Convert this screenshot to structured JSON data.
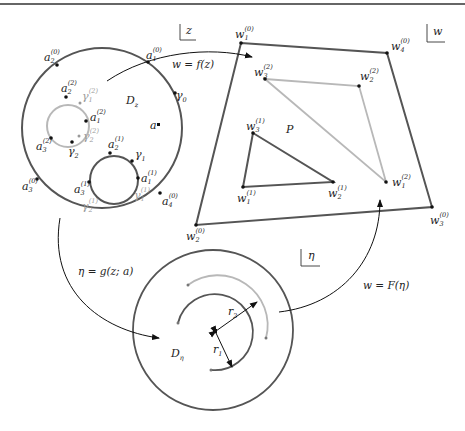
{
  "figure": {
    "top_rule": true,
    "colors": {
      "dark": "#555555",
      "light": "#b8b8b8",
      "ink": "#111111"
    },
    "planes": {
      "z": {
        "label": "z"
      },
      "w": {
        "label": "w"
      },
      "eta": {
        "label": "η"
      }
    },
    "domain_z": {
      "label": "D",
      "sub": "z",
      "point_a": "a",
      "outer_boundary": "γ",
      "outer_boundary_sub": "0",
      "outer_vertices": [
        {
          "base": "a",
          "sub": "1",
          "sup": "(0)"
        },
        {
          "base": "a",
          "sub": "2",
          "sup": "(0)"
        },
        {
          "base": "a",
          "sub": "3",
          "sup": "(0)"
        },
        {
          "base": "a",
          "sub": "4",
          "sup": "(0)"
        }
      ],
      "hole_1": {
        "boundary": "γ",
        "boundary_sub": "1",
        "vertices": [
          {
            "base": "a",
            "sub": "1",
            "sup": "(1)"
          },
          {
            "base": "a",
            "sub": "2",
            "sup": "(1)"
          },
          {
            "base": "a",
            "sub": "3",
            "sup": "(1)"
          }
        ],
        "arcs": [
          {
            "base": "γ",
            "sub": "1",
            "sup": "(1)"
          },
          {
            "base": "γ",
            "sub": "2",
            "sup": "(1)"
          }
        ]
      },
      "hole_2": {
        "boundary": "γ",
        "boundary_sub": "2",
        "vertices": [
          {
            "base": "a",
            "sub": "1",
            "sup": "(2)"
          },
          {
            "base": "a",
            "sub": "2",
            "sup": "(2)"
          },
          {
            "base": "a",
            "sub": "3",
            "sup": "(2)"
          }
        ],
        "arcs": [
          {
            "base": "γ",
            "sub": "1",
            "sup": "(2)"
          },
          {
            "base": "γ",
            "sub": "2",
            "sup": "(2)"
          }
        ]
      }
    },
    "polygon_w": {
      "label": "P",
      "outer_vertices": [
        {
          "base": "w",
          "sub": "1",
          "sup": "(0)"
        },
        {
          "base": "w",
          "sub": "2",
          "sup": "(0)"
        },
        {
          "base": "w",
          "sub": "3",
          "sup": "(0)"
        },
        {
          "base": "w",
          "sub": "4",
          "sup": "(0)"
        }
      ],
      "hole_1_vertices": [
        {
          "base": "w",
          "sub": "1",
          "sup": "(1)"
        },
        {
          "base": "w",
          "sub": "2",
          "sup": "(1)"
        },
        {
          "base": "w",
          "sub": "3",
          "sup": "(1)"
        }
      ],
      "hole_2_vertices": [
        {
          "base": "w",
          "sub": "1",
          "sup": "(2)"
        },
        {
          "base": "w",
          "sub": "2",
          "sup": "(2)"
        },
        {
          "base": "w",
          "sub": "3",
          "sup": "(2)"
        }
      ]
    },
    "domain_eta": {
      "label": "D",
      "sub": "η",
      "radius_1": "r",
      "radius_1_sub": "1",
      "radius_2": "r",
      "radius_2_sub": "2"
    },
    "maps": {
      "f": "w = f(z)",
      "g": "η = g(z; a)",
      "F": "w = F(η)"
    }
  }
}
